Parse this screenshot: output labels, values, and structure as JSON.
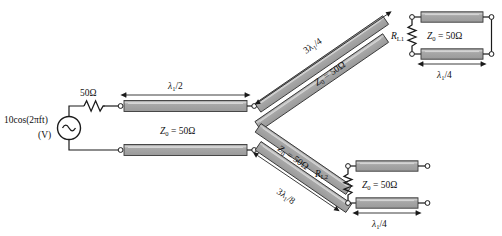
{
  "figure": {
    "width": 502,
    "height": 236,
    "background": "#ffffff",
    "line_fill": "#a3a3a3",
    "line_stroke": "#3a3a3a",
    "line_highlight": "#c9c9c9",
    "ink": "#1a1a1a"
  },
  "source": {
    "name": "voltage-source",
    "label_line1": "10cos(2πft)",
    "label_line2": "(V)",
    "symbol": "sine-source-icon"
  },
  "series_resistor": {
    "name": "series-resistor",
    "label": "50Ω",
    "symbol": "resistor-zigzag-icon"
  },
  "main_line": {
    "name": "main-transmission-line",
    "length_label": "λ₁/2",
    "length_label_base": "λ",
    "length_label_sub": "1",
    "length_label_tail": "/2",
    "impedance_label": "Z₀ = 50Ω",
    "impedance_base": "Z",
    "impedance_sub": "0",
    "impedance_tail": " = 50Ω"
  },
  "upper_branch": {
    "name": "upper-branch-line",
    "length_label": "3λ₁/4",
    "length_base": "3λ",
    "length_sub": "1",
    "length_tail": "/4",
    "impedance_label": "Z₀ = 50Ω",
    "impedance_base": "Z",
    "impedance_sub": "0",
    "impedance_tail": " = 50Ω"
  },
  "lower_branch": {
    "name": "lower-branch-line",
    "length_label": "3λ₁/8",
    "length_base": "3λ",
    "length_sub": "1",
    "length_tail": "/8",
    "impedance_label": "Z₀ = 50Ω",
    "impedance_base": "Z",
    "impedance_sub": "0",
    "impedance_tail": " = 50Ω"
  },
  "load1": {
    "name": "load-resistor-1",
    "label_base": "R",
    "label_sub": "L1",
    "label": "Rₗ₁"
  },
  "load2": {
    "name": "load-resistor-2",
    "label_base": "R",
    "label_sub": "L2",
    "label": "Rₗ₂"
  },
  "stub_upper": {
    "name": "upper-quarter-wave-stub",
    "impedance_base": "Z",
    "impedance_sub": "0",
    "impedance_tail": " = 50Ω",
    "impedance_label": "Z₀ = 50Ω",
    "length_base": "λ",
    "length_sub": "1",
    "length_tail": "/4",
    "length_label": "λ₁/4",
    "termination": "short-circuit"
  },
  "stub_lower": {
    "name": "lower-quarter-wave-stub",
    "impedance_base": "Z",
    "impedance_sub": "0",
    "impedance_tail": " = 50Ω",
    "impedance_label": "Z₀ = 50Ω",
    "length_base": "λ",
    "length_sub": "1",
    "length_tail": "/4",
    "length_label": "λ₁/4",
    "termination": "open-circuit"
  }
}
